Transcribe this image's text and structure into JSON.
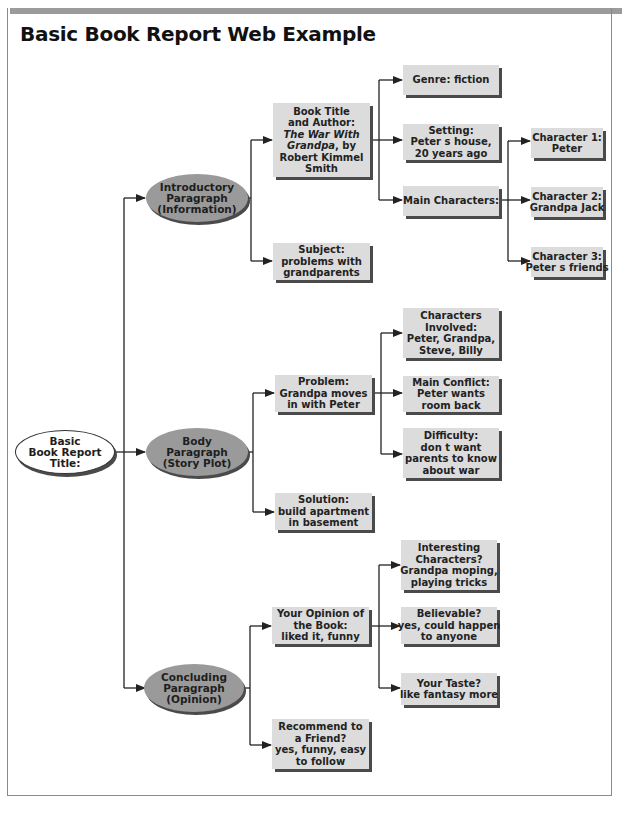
{
  "title": "Basic Book Report Web Example",
  "colors": {
    "box_fill": "#dcdcdc",
    "oval_fill": "#9a9a9a",
    "shadow": "#4a4a4a",
    "line": "#222222",
    "top_bar": "#9b9b9b"
  },
  "root": {
    "lines": [
      "Basic",
      "Book Report",
      "Title:"
    ]
  },
  "sections": [
    {
      "id": "intro",
      "lines": [
        "Introductory",
        "Paragraph",
        "(Information)"
      ],
      "children": [
        {
          "id": "book-title",
          "lines": [
            "Book Title",
            "and Author:",
            "The War With",
            "Grandpa, by",
            "Robert Kimmel",
            "Smith"
          ],
          "children": [
            {
              "id": "genre",
              "lines": [
                "Genre: fiction"
              ]
            },
            {
              "id": "setting",
              "lines": [
                "Setting:",
                "Peter s house,",
                "20 years ago"
              ]
            },
            {
              "id": "main-characters",
              "lines": [
                "Main Characters:"
              ],
              "children": [
                {
                  "id": "char1",
                  "lines": [
                    "Character 1:",
                    "Peter"
                  ]
                },
                {
                  "id": "char2",
                  "lines": [
                    "Character 2:",
                    "Grandpa Jack"
                  ]
                },
                {
                  "id": "char3",
                  "lines": [
                    "Character 3:",
                    "Peter s friends"
                  ]
                }
              ]
            }
          ]
        },
        {
          "id": "subject",
          "lines": [
            "Subject:",
            "problems with",
            "grandparents"
          ]
        }
      ]
    },
    {
      "id": "body",
      "lines": [
        "Body",
        "Paragraph",
        "(Story Plot)"
      ],
      "children": [
        {
          "id": "problem",
          "lines": [
            "Problem:",
            "Grandpa moves",
            "in with Peter"
          ],
          "children": [
            {
              "id": "characters-involved",
              "lines": [
                "Characters",
                "Involved:",
                "Peter, Grandpa,",
                "Steve, Billy"
              ]
            },
            {
              "id": "main-conflict",
              "lines": [
                "Main Conflict:",
                "Peter wants",
                "room back"
              ]
            },
            {
              "id": "difficulty",
              "lines": [
                "Difficulty:",
                "don t want",
                "parents to know",
                "about  war"
              ]
            }
          ]
        },
        {
          "id": "solution",
          "lines": [
            "Solution:",
            "build apartment",
            "in basement"
          ]
        }
      ]
    },
    {
      "id": "concluding",
      "lines": [
        "Concluding",
        "Paragraph",
        "(Opinion)"
      ],
      "children": [
        {
          "id": "opinion",
          "lines": [
            "Your Opinion of",
            "the Book:",
            "liked it, funny"
          ],
          "children": [
            {
              "id": "interesting",
              "lines": [
                "Interesting",
                "Characters?",
                "Grandpa moping,",
                "playing tricks"
              ]
            },
            {
              "id": "believable",
              "lines": [
                "Believable?",
                "yes, could happen",
                "to anyone"
              ]
            },
            {
              "id": "taste",
              "lines": [
                "Your Taste?",
                "like fantasy more"
              ]
            }
          ]
        },
        {
          "id": "recommend",
          "lines": [
            "Recommend to",
            "a Friend?",
            "yes, funny, easy",
            "to follow"
          ]
        }
      ]
    }
  ]
}
